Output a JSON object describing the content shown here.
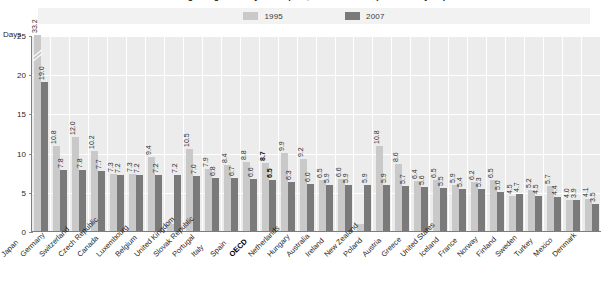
{
  "title": "Average length of stay in hospital, 1995 and 2007 (or nearest year)",
  "axis": {
    "y_title": "Days",
    "y_ticks": [
      "0",
      "5",
      "10",
      "15",
      "20",
      "25"
    ],
    "y_min": 0,
    "y_max": 25
  },
  "legend": {
    "items": [
      {
        "label": "1995",
        "color": "#c9c9c9"
      },
      {
        "label": "2007",
        "color": "#7a7a7a"
      }
    ]
  },
  "chart_data": {
    "type": "bar",
    "title": "Average length of stay in hospital, 1995 and 2007 (or nearest year)",
    "xlabel": "",
    "ylabel": "Days",
    "ylim": [
      0,
      25
    ],
    "grid": true,
    "legend_position": "top",
    "note": "Japan 1995 bar is truncated with an axis break (actual value 33.2). United Kingdom and New Zealand have no 1995 value.",
    "categories": [
      "Japan",
      "Germany",
      "Switzerland",
      "Czech Republic",
      "Canada",
      "Luxembourg",
      "Belgium",
      "United Kingdom",
      "Slovak Republic",
      "Portugal",
      "Italy",
      "Spain",
      "OECD",
      "Netherlands",
      "Hungary",
      "Australia",
      "Ireland",
      "New Zealand",
      "Poland",
      "Austria",
      "Greece",
      "United States",
      "Iceland",
      "France",
      "Norway",
      "Finland",
      "Sweden",
      "Turkey",
      "Mexico",
      "Denmark"
    ],
    "highlight_category": "OECD",
    "series": [
      {
        "name": "1995",
        "color": "#c9c9c9",
        "values": [
          33.2,
          10.8,
          12.0,
          10.2,
          7.3,
          7.3,
          9.4,
          null,
          10.5,
          7.9,
          8.4,
          8.8,
          8.7,
          9.9,
          9.2,
          6.5,
          6.6,
          null,
          10.8,
          8.6,
          6.4,
          6.5,
          5.9,
          6.2,
          6.5,
          4.5,
          5.2,
          5.7,
          4.0,
          4.1
        ],
        "labels": [
          "33.2",
          "10.8",
          "12.0",
          "10.2",
          "7.3",
          "7.3",
          "9.4",
          "",
          "10.5",
          "7.9",
          "8.4",
          "8.8",
          "8.7",
          "9.9",
          "9.2",
          "6.5",
          "6.6",
          "",
          "10.8",
          "8.6",
          "6.4",
          "6.5",
          "5.9",
          "6.2",
          "6.5",
          "4.5",
          "5.2",
          "5.7",
          "4.0",
          "4.1"
        ]
      },
      {
        "name": "2007",
        "color": "#7a7a7a",
        "values": [
          19.0,
          7.8,
          7.8,
          7.7,
          7.2,
          7.2,
          7.2,
          7.2,
          7.0,
          6.8,
          6.7,
          6.6,
          6.5,
          6.3,
          6.0,
          5.9,
          5.9,
          5.9,
          5.9,
          5.7,
          5.6,
          5.5,
          5.4,
          5.3,
          5.0,
          4.7,
          4.5,
          4.4,
          3.9,
          3.5
        ],
        "labels": [
          "19.0",
          "7.8",
          "7.8",
          "7.7",
          "7.2",
          "7.2",
          "7.2",
          "7.2",
          "7.0",
          "6.8",
          "6.7",
          "6.6",
          "6.5",
          "6.3",
          "6.0",
          "5.9",
          "5.9",
          "5.9",
          "5.9",
          "5.7",
          "5.6",
          "5.5",
          "5.4",
          "5.3",
          "5.0",
          "4.7",
          "4.5",
          "4.4",
          "3.9",
          "3.5"
        ]
      }
    ]
  }
}
